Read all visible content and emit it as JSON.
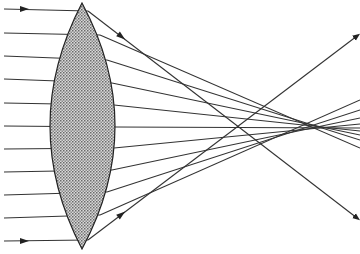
{
  "diagram": {
    "title": "",
    "colors": {
      "background": "#ffffff",
      "line": "#333333",
      "lens_fill": "#bdbdbd"
    },
    "lens": {
      "cx": 82,
      "top": 3,
      "bottom": 249,
      "half_width_left": 32,
      "half_width_right": 33
    },
    "rays": [
      {
        "y": 9,
        "exit": [
          88,
          11
        ],
        "end": [
          357,
          218
        ],
        "arrows": [
          [
            25,
            9
          ],
          [
            122,
            37
          ]
        ]
      },
      {
        "y": 33,
        "exit": [
          100,
          35
        ],
        "end": [
          360,
          148
        ]
      },
      {
        "y": 56,
        "exit": [
          107,
          60
        ],
        "end": [
          360,
          140
        ]
      },
      {
        "y": 79,
        "exit": [
          112,
          83
        ],
        "end": [
          360,
          135
        ]
      },
      {
        "y": 103,
        "exit": [
          114,
          105
        ],
        "end": [
          360,
          131
        ]
      },
      {
        "y": 126,
        "exit": [
          115,
          127
        ],
        "end": [
          360,
          128
        ]
      },
      {
        "y": 149,
        "exit": [
          114,
          148
        ],
        "end": [
          360,
          124
        ]
      },
      {
        "y": 172,
        "exit": [
          112,
          170
        ],
        "end": [
          360,
          118
        ]
      },
      {
        "y": 195,
        "exit": [
          107,
          192
        ],
        "end": [
          360,
          110
        ]
      },
      {
        "y": 218,
        "exit": [
          100,
          215
        ],
        "end": [
          360,
          100
        ]
      },
      {
        "y": 241,
        "exit": [
          88,
          240
        ],
        "end": [
          357,
          36
        ],
        "arrows": [
          [
            25,
            241
          ],
          [
            122,
            214
          ]
        ]
      }
    ]
  }
}
